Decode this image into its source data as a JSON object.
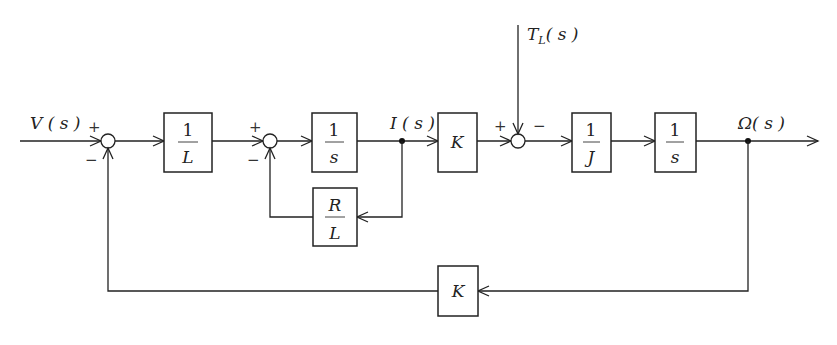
{
  "diagram": {
    "type": "block-diagram",
    "signals": {
      "input": "V ( s )",
      "current": "I ( s )",
      "disturbance": "T",
      "disturbance_sub": "L",
      "disturbance_tail": "( s )",
      "output": "Ω( s )"
    },
    "blocks": [
      {
        "id": "inv-L",
        "num": "1",
        "den": "L"
      },
      {
        "id": "integrator-1",
        "num": "1",
        "den": "s"
      },
      {
        "id": "gain-K",
        "label": "K"
      },
      {
        "id": "inv-J",
        "num": "1",
        "den": "J"
      },
      {
        "id": "integrator-2",
        "num": "1",
        "den": "s"
      },
      {
        "id": "feedback-R-over-L",
        "num": "R",
        "den": "L"
      },
      {
        "id": "feedback-K",
        "label": "K"
      }
    ],
    "summing_junctions": [
      {
        "id": "sum-1",
        "signs": [
          "+",
          "−"
        ]
      },
      {
        "id": "sum-2",
        "signs": [
          "+",
          "−"
        ]
      },
      {
        "id": "sum-3",
        "signs": [
          "+",
          "−"
        ]
      }
    ],
    "connections": [
      "V(s) → sum-1 (+)",
      "sum-1 → 1/L",
      "1/L → sum-2 (+)",
      "sum-2 → 1/s",
      "1/s → I(s)",
      "I(s) → R/L → sum-2 (−)",
      "I(s) → K",
      "K → sum-3 (+)",
      "T_L(s) → sum-3 (−)",
      "sum-3 → 1/J",
      "1/J → 1/s",
      "1/s → Ω(s)",
      "Ω(s) → K → sum-1 (−)"
    ]
  }
}
